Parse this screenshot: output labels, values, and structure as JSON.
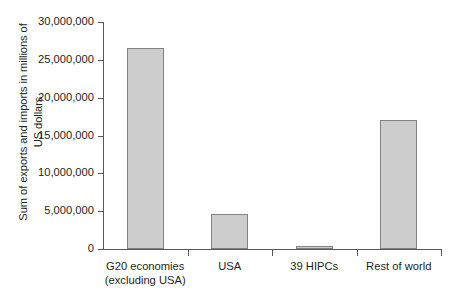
{
  "chart_data": {
    "type": "bar",
    "title": "",
    "subtitle": "",
    "xlabel": "",
    "ylabel": "Sum of exports and imports in millions of\nUS dollars",
    "categories": [
      "G20 economies\n(excluding USA)",
      "USA",
      "39 HIPCs",
      "Rest of world"
    ],
    "values": [
      26500000,
      4600000,
      400000,
      17100000
    ],
    "ylim": [
      0,
      30000000
    ],
    "ytick_values": [
      0,
      5000000,
      10000000,
      15000000,
      20000000,
      25000000,
      30000000
    ],
    "ytick_labels": [
      "0",
      "5,000,000",
      "10,000,000",
      "15,000,000",
      "20,000,000",
      "25,000,000",
      "30,000,000"
    ],
    "grid": false,
    "legend": null,
    "bar_fill_color": "#cdcdcd",
    "bar_border_color": "#808285",
    "axis_color": "#58595b",
    "text_color": "#231f20",
    "background_color": "#ffffff"
  }
}
